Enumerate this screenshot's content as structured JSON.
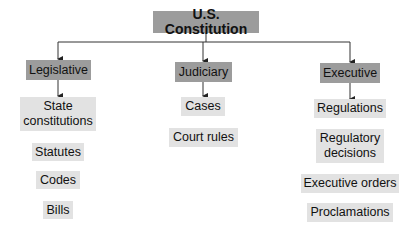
{
  "diagram": {
    "root": {
      "label": "U.S. Constitution"
    },
    "branches": [
      {
        "label": "Legislative",
        "children": [
          "State constitutions",
          "Statutes",
          "Codes",
          "Bills"
        ]
      },
      {
        "label": "Judiciary",
        "children": [
          "Cases",
          "Court rules"
        ]
      },
      {
        "label": "Executive",
        "children": [
          "Regulations",
          "Regulatory decisions",
          "Executive orders",
          "Proclamations"
        ]
      }
    ],
    "colors": {
      "root_fill": "#9c9c9c",
      "branch_fill": "#9c9c9c",
      "leaf_fill": "#e2e2e2",
      "line": "#333333"
    }
  }
}
